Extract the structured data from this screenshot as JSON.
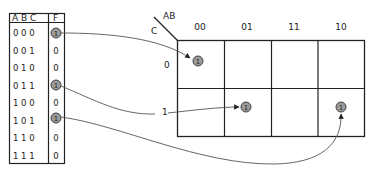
{
  "truth_table": {
    "headers": {
      "inputs": "A B C",
      "output": "F"
    },
    "rows": [
      {
        "abc": "0 0 0",
        "f": "1",
        "highlight": true
      },
      {
        "abc": "0 0 1",
        "f": "0",
        "highlight": false
      },
      {
        "abc": "0 1 0",
        "f": "0",
        "highlight": false
      },
      {
        "abc": "0 1 1",
        "f": "1",
        "highlight": true
      },
      {
        "abc": "1 0 0",
        "f": "0",
        "highlight": false
      },
      {
        "abc": "1 0 1",
        "f": "1",
        "highlight": true
      },
      {
        "abc": "1 1 0",
        "f": "0",
        "highlight": false
      },
      {
        "abc": "1 1 1",
        "f": "0",
        "highlight": false
      }
    ]
  },
  "kmap": {
    "row_var": "C",
    "col_var": "AB",
    "col_labels": [
      "00",
      "01",
      "11",
      "10"
    ],
    "row_labels": [
      "0",
      "1"
    ],
    "ones": [
      {
        "row": 0,
        "col": 0,
        "value": "1"
      },
      {
        "row": 1,
        "col": 1,
        "value": "1"
      },
      {
        "row": 1,
        "col": 3,
        "value": "1"
      }
    ]
  },
  "colors": {
    "line": "#222222",
    "circle_fill": "#9a9a9a",
    "circle_stroke": "#333333",
    "arrow": "#555555"
  }
}
